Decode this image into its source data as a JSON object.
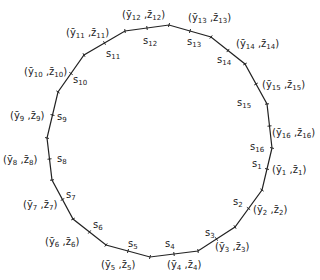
{
  "diagram": {
    "vertices": [
      {
        "id": 1,
        "x": 268,
        "y": 188
      },
      {
        "id": 2,
        "x": 245,
        "y": 209
      },
      {
        "id": 3,
        "x": 235,
        "y": 227
      },
      {
        "id": 4,
        "x": 198,
        "y": 251
      },
      {
        "id": 5,
        "x": 150,
        "y": 257
      },
      {
        "id": 6,
        "x": 106,
        "y": 245
      },
      {
        "id": 7,
        "x": 73,
        "y": 219
      },
      {
        "id": 8,
        "x": 52,
        "y": 180
      },
      {
        "id": 9,
        "x": 47,
        "y": 138
      },
      {
        "id": 10,
        "x": 58,
        "y": 92
      },
      {
        "id": 11,
        "x": 84,
        "y": 55
      },
      {
        "id": 12,
        "x": 125,
        "y": 31
      },
      {
        "id": 13,
        "x": 169,
        "y": 25
      },
      {
        "id": 14,
        "x": 211,
        "y": 37
      },
      {
        "id": 15,
        "x": 245,
        "y": 64
      },
      {
        "id": 16,
        "x": 267,
        "y": 104
      },
      {
        "id": 17,
        "x": 272,
        "y": 148
      }
    ],
    "polygon": [
      [
        272,
        148
      ],
      [
        262,
        190
      ],
      [
        235,
        227
      ],
      [
        198,
        251
      ],
      [
        150,
        257
      ],
      [
        106,
        245
      ],
      [
        73,
        219
      ],
      [
        52,
        180
      ],
      [
        47,
        138
      ],
      [
        58,
        92
      ],
      [
        84,
        55
      ],
      [
        125,
        31
      ],
      [
        169,
        25
      ],
      [
        211,
        37
      ],
      [
        245,
        64
      ],
      [
        267,
        104
      ],
      [
        272,
        148
      ]
    ],
    "side_labels": [
      {
        "text": "s",
        "sub": "1",
        "x": 252,
        "y": 167
      },
      {
        "text": "s",
        "sub": "2",
        "x": 233,
        "y": 205
      },
      {
        "text": "s",
        "sub": "3",
        "x": 205,
        "y": 236
      },
      {
        "text": "s",
        "sub": "4",
        "x": 165,
        "y": 247
      },
      {
        "text": "s",
        "sub": "5",
        "x": 128,
        "y": 247
      },
      {
        "text": "s",
        "sub": "6",
        "x": 93,
        "y": 228
      },
      {
        "text": "s",
        "sub": "7",
        "x": 66,
        "y": 198
      },
      {
        "text": "s",
        "sub": "8",
        "x": 57,
        "y": 162
      },
      {
        "text": "s",
        "sub": "9",
        "x": 57,
        "y": 120
      },
      {
        "text": "s",
        "sub": "10",
        "x": 73,
        "y": 83
      },
      {
        "text": "s",
        "sub": "11",
        "x": 106,
        "y": 57
      },
      {
        "text": "s",
        "sub": "12",
        "x": 143,
        "y": 44
      },
      {
        "text": "s",
        "sub": "13",
        "x": 187,
        "y": 45
      },
      {
        "text": "s",
        "sub": "14",
        "x": 217,
        "y": 63
      },
      {
        "text": "s",
        "sub": "15",
        "x": 237,
        "y": 106
      },
      {
        "text": "s",
        "sub": "16",
        "x": 250,
        "y": 150
      }
    ],
    "vertex_labels": [
      {
        "y_sub": "1",
        "z_sub": "1",
        "x": 272,
        "y": 173
      },
      {
        "y_sub": "2",
        "z_sub": "2",
        "x": 253,
        "y": 213
      },
      {
        "y_sub": "3",
        "z_sub": "3",
        "x": 215,
        "y": 250
      },
      {
        "y_sub": "4",
        "z_sub": "4",
        "x": 167,
        "y": 268
      },
      {
        "y_sub": "5",
        "z_sub": "5",
        "x": 101,
        "y": 268
      },
      {
        "y_sub": "6",
        "z_sub": "6",
        "x": 45,
        "y": 245
      },
      {
        "y_sub": "7",
        "z_sub": "7",
        "x": 23,
        "y": 208
      },
      {
        "y_sub": "8",
        "z_sub": "8",
        "x": 3,
        "y": 163
      },
      {
        "y_sub": "9",
        "z_sub": "9",
        "x": 10,
        "y": 119
      },
      {
        "y_sub": "10",
        "z_sub": "10",
        "x": 24,
        "y": 75
      },
      {
        "y_sub": "11",
        "z_sub": "11",
        "x": 66,
        "y": 36
      },
      {
        "y_sub": "12",
        "z_sub": "12",
        "x": 122,
        "y": 18
      },
      {
        "y_sub": "13",
        "z_sub": "13",
        "x": 188,
        "y": 21
      },
      {
        "y_sub": "14",
        "z_sub": "14",
        "x": 236,
        "y": 47
      },
      {
        "y_sub": "15",
        "z_sub": "15",
        "x": 262,
        "y": 88
      },
      {
        "y_sub": "16",
        "z_sub": "16",
        "x": 272,
        "y": 136
      }
    ]
  }
}
